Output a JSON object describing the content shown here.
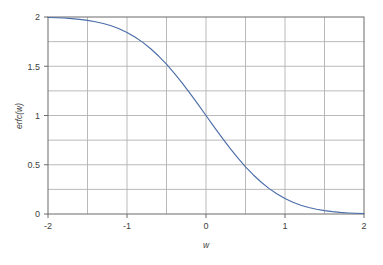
{
  "chart_data": {
    "type": "line",
    "title": "",
    "subtitle": "",
    "xlabel": "w",
    "ylabel": "erfc(w)",
    "xlim": [
      -2,
      2
    ],
    "ylim": [
      0,
      2
    ],
    "grid": true,
    "legend": false,
    "legend_position": "none",
    "x_major_ticks": [
      -2,
      -1,
      0,
      1,
      2
    ],
    "x_major_tick_labels": [
      "-2",
      "-1",
      "0",
      "1",
      "2"
    ],
    "x_gridline_values": [
      -2,
      -1.5,
      -1,
      -0.5,
      0,
      0.5,
      1,
      1.5,
      2
    ],
    "y_major_ticks": [
      0,
      0.5,
      1,
      1.5,
      2
    ],
    "y_major_tick_labels": [
      "0",
      "0.5",
      "1",
      "1.5",
      "2"
    ],
    "y_gridline_values": [
      0,
      0.25,
      0.5,
      0.75,
      1,
      1.25,
      1.5,
      1.75,
      2
    ],
    "series": [
      {
        "name": "erfc(w)",
        "color": "#4a6ca8",
        "line_width": 1.1,
        "x": [
          -2,
          -1.9,
          -1.8,
          -1.7,
          -1.6,
          -1.5,
          -1.4,
          -1.3,
          -1.2,
          -1.1,
          -1,
          -0.9,
          -0.8,
          -0.7,
          -0.6,
          -0.5,
          -0.4,
          -0.3,
          -0.2,
          -0.1,
          0,
          0.1,
          0.2,
          0.3,
          0.4,
          0.5,
          0.6,
          0.7,
          0.8,
          0.9,
          1,
          1.1,
          1.2,
          1.3,
          1.4,
          1.5,
          1.6,
          1.7,
          1.8,
          1.9,
          2
        ],
        "values": [
          1.9953,
          1.9928,
          1.9891,
          1.9838,
          1.9763,
          1.9661,
          1.9523,
          1.934,
          1.9103,
          1.8802,
          1.8427,
          1.7969,
          1.7421,
          1.6778,
          1.6039,
          1.5205,
          1.4284,
          1.3286,
          1.2227,
          1.1125,
          1.0,
          0.8875,
          0.7773,
          0.6714,
          0.5716,
          0.4795,
          0.3961,
          0.3222,
          0.2579,
          0.2031,
          0.1573,
          0.1198,
          0.0897,
          0.066,
          0.0477,
          0.0339,
          0.0237,
          0.0162,
          0.0109,
          0.0072,
          0.0047
        ]
      }
    ],
    "colors": {
      "curve": "#4a6ca8",
      "gridline": "#b2b2b2",
      "axis_line": "#6b6b6b",
      "tick_label": "#3f3f3f",
      "plot_background": "#ffffff",
      "figure_background": "#ffffff"
    },
    "plot_area": {
      "left": 48,
      "top": 17,
      "right": 364,
      "bottom": 214
    }
  }
}
